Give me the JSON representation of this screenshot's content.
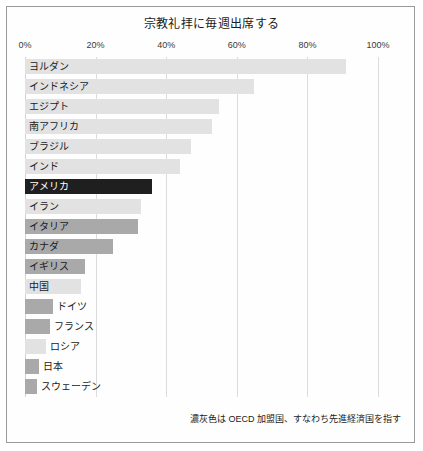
{
  "chart_data": {
    "type": "bar",
    "orientation": "horizontal",
    "title": "宗教礼拝に毎週出席する",
    "xlabel": "",
    "ylabel": "",
    "xlim": [
      0,
      100
    ],
    "grid": true,
    "legend": "none",
    "tick_labels": [
      "0%",
      "20%",
      "40%",
      "60%",
      "80%",
      "100%"
    ],
    "tick_values": [
      0,
      20,
      40,
      60,
      80,
      100
    ],
    "annotation": "濃灰色は OECD 加盟国、すなわち先進経済国を指す",
    "categories": [
      "ヨルダン",
      "インドネシア",
      "エジプト",
      "南アフリカ",
      "ブラジル",
      "インド",
      "アメリカ",
      "イラン",
      "イタリア",
      "カナダ",
      "イギリス",
      "中国",
      "ドイツ",
      "フランス",
      "ロシア",
      "日本",
      "スウェーデン"
    ],
    "values": [
      91,
      65,
      55,
      53,
      47,
      44,
      36,
      33,
      32,
      25,
      17,
      16,
      8,
      7,
      6,
      4,
      3.5
    ],
    "groups": [
      "non-oecd",
      "non-oecd",
      "non-oecd",
      "non-oecd",
      "non-oecd",
      "non-oecd",
      "highlight",
      "non-oecd",
      "oecd",
      "oecd",
      "oecd",
      "non-oecd",
      "oecd",
      "oecd",
      "non-oecd",
      "oecd",
      "oecd"
    ],
    "colors": {
      "oecd": "#a9a9a9",
      "non_oecd": "#e2e2e2",
      "highlight": "#1f1f1f",
      "gridline": "#dcdcdc",
      "text": "#1b1b1b",
      "frame": "#9a9a9a"
    }
  }
}
